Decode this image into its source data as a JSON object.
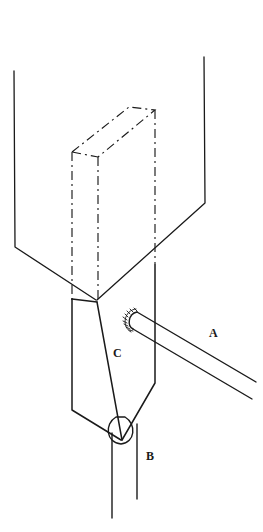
{
  "figure": {
    "kind": "technical-line-drawing",
    "background_color": "#ffffff",
    "ink_color": "#1a1a1a",
    "labels": [
      {
        "id": "A",
        "text": "A",
        "x": 213,
        "y": 333,
        "refers_to": "rod-a"
      },
      {
        "id": "B",
        "text": "B",
        "x": 150,
        "y": 456,
        "refers_to": "cylinder-b"
      },
      {
        "id": "C",
        "text": "C",
        "x": 117,
        "y": 353,
        "refers_to": "prism-c"
      }
    ],
    "parts": {
      "rod_a": {
        "name": "rod-a",
        "style": "solid",
        "description": "cylindrical rod extending down-right from a knurled collar"
      },
      "cylinder_b": {
        "name": "cylinder-b",
        "style": "solid",
        "description": "vertical cylinder below the prism with elliptical top"
      },
      "prism_c": {
        "name": "prism-c",
        "style": "solid",
        "description": "wedge shaped vertical prism with pointed lower end"
      },
      "phantom_block": {
        "name": "phantom-block",
        "style": "dash-dot",
        "description": "hidden rectangular block outline drawn in dash-dot lines"
      },
      "frame": {
        "name": "outer-frame",
        "style": "solid",
        "description": "large V shaped outer frame lines"
      },
      "collar": {
        "name": "knurled-collar",
        "style": "hatched-arc",
        "description": "small serrated arc at the rod root"
      }
    }
  }
}
